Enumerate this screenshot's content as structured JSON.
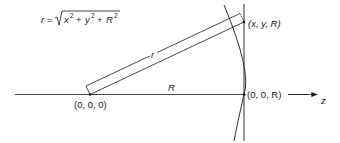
{
  "diagram": {
    "formula": {
      "lhs": "r",
      "eq": " = ",
      "x": "x",
      "y": "y",
      "R": "R",
      "exp": "2",
      "plus": " + "
    },
    "labels": {
      "point_xyR": "(x, y, R)",
      "origin": "(0, 0, 0)",
      "point_00R": "(0, 0, R)",
      "distance_R": "R",
      "distance_r": "r",
      "axis_z": "z"
    },
    "colors": {
      "line": "#1a1a1a",
      "background": "#ffffff"
    }
  }
}
